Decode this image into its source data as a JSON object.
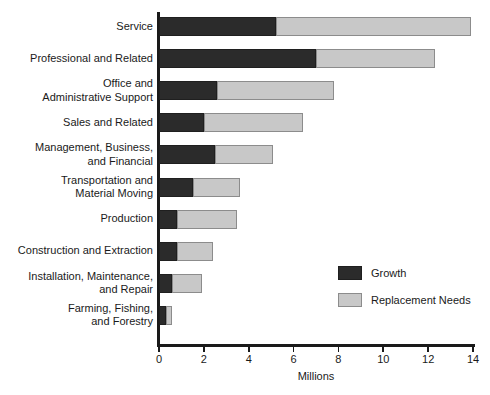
{
  "chart_data": {
    "type": "bar",
    "orientation": "horizontal",
    "stacked": true,
    "title": "",
    "xlabel": "Millions",
    "ylabel": "",
    "xlim": [
      0,
      14
    ],
    "xticks": [
      0,
      2,
      4,
      6,
      8,
      10,
      12,
      14
    ],
    "xtick_labels": [
      "0",
      "2",
      "4",
      "6",
      "8",
      "10",
      "12",
      "14"
    ],
    "grid": false,
    "legend_position": "center-right",
    "categories": [
      "Service",
      "Professional and Related",
      "Office and\nAdministrative Support",
      "Sales and Related",
      "Management, Business,\nand Financial",
      "Transportation and\nMaterial Moving",
      "Production",
      "Construction and Extraction",
      "Installation, Maintenance,\nand Repair",
      "Farming, Fishing,\nand Forestry"
    ],
    "series": [
      {
        "name": "Growth",
        "color": "#2b2b2b",
        "values": [
          5.2,
          7.0,
          2.6,
          2.0,
          2.5,
          1.5,
          0.8,
          0.8,
          0.6,
          0.3
        ]
      },
      {
        "name": "Replacement Needs",
        "color": "#c8c8c8",
        "values": [
          8.7,
          5.3,
          5.2,
          4.4,
          2.6,
          2.1,
          2.7,
          1.6,
          1.3,
          0.3
        ]
      }
    ],
    "totals": [
      13.9,
      12.3,
      7.8,
      6.4,
      5.1,
      3.6,
      3.5,
      2.4,
      1.9,
      0.6
    ]
  },
  "legend": {
    "items": [
      {
        "label": "Growth",
        "color": "#2b2b2b"
      },
      {
        "label": "Replacement Needs",
        "color": "#c8c8c8"
      }
    ]
  }
}
